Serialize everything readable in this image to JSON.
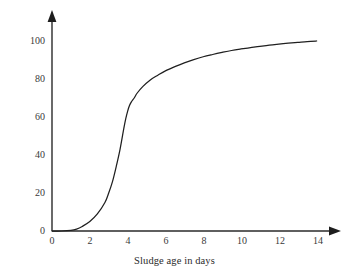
{
  "chart_data": {
    "type": "line",
    "title": "",
    "xlabel": "Sludge age in days",
    "ylabel": "Nitrification %",
    "xlim": [
      0,
      14.8
    ],
    "ylim": [
      0,
      105
    ],
    "grid": false,
    "legend": "none",
    "axis_style": "arrow-tipped L-frame, no tick marks",
    "line_color": "#1f1f1f",
    "background_color": "#ffffff",
    "xticks": [
      "0",
      "2",
      "4",
      "6",
      "8",
      "10",
      "12",
      "14"
    ],
    "xtick_values": [
      0,
      2,
      4,
      6,
      8,
      10,
      12,
      14
    ],
    "yticks": [
      "0",
      "20",
      "40",
      "60",
      "80",
      "100"
    ],
    "ytick_values": [
      0,
      20,
      40,
      60,
      80,
      100
    ],
    "series": [
      {
        "name": "Nitrification",
        "x": [
          0.0,
          0.5,
          1.0,
          1.3,
          1.6,
          2.0,
          2.4,
          2.8,
          3.0,
          3.2,
          3.4,
          3.6,
          3.8,
          3.9,
          4.0,
          4.1,
          4.2,
          4.35,
          4.5,
          4.8,
          5.2,
          5.6,
          6.0,
          6.5,
          7.0,
          7.5,
          8.0,
          8.5,
          9.0,
          9.5,
          10.0,
          10.5,
          11.0,
          11.5,
          12.0,
          12.5,
          13.0,
          13.5,
          14.0
        ],
        "y": [
          0.0,
          0.0,
          0.3,
          1.0,
          2.4,
          5.0,
          9.0,
          15.0,
          20.0,
          26.0,
          34.0,
          43.0,
          54.0,
          59.0,
          63.0,
          66.0,
          68.0,
          70.0,
          72.5,
          76.0,
          79.5,
          82.0,
          84.3,
          86.5,
          88.5,
          90.2,
          91.7,
          92.9,
          94.0,
          95.0,
          95.8,
          96.5,
          97.2,
          97.8,
          98.4,
          98.9,
          99.3,
          99.7,
          100.0
        ]
      }
    ]
  }
}
